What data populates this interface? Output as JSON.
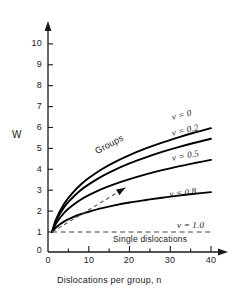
{
  "chart_data": {
    "type": "line",
    "title": "",
    "xlabel": "Dislocations per group, n",
    "ylabel": "W",
    "xlim": [
      0,
      42
    ],
    "ylim": [
      0,
      10.6
    ],
    "xticks": [
      0,
      10,
      20,
      30,
      40
    ],
    "xtick_labels": [
      "0",
      "10",
      "20",
      "30",
      "40"
    ],
    "x_minor_ticks": [
      5,
      15,
      25,
      35
    ],
    "yticks": [
      0,
      1,
      2,
      3,
      4,
      5,
      6,
      7,
      8,
      9,
      10
    ],
    "ytick_labels": [
      "0",
      "1",
      "2",
      "3",
      "4",
      "5",
      "6",
      "7",
      "8",
      "9",
      "10"
    ],
    "grid": false,
    "legend_position": "inline-curve-labels",
    "series": [
      {
        "name": "ν = 0",
        "label": "ν = 0",
        "style": "solid",
        "x": [
          1,
          2,
          4,
          6,
          8,
          10,
          13,
          16,
          20,
          24,
          28,
          32,
          36,
          40
        ],
        "y": [
          1.0,
          1.62,
          2.36,
          2.86,
          3.26,
          3.58,
          3.98,
          4.31,
          4.68,
          5.0,
          5.28,
          5.53,
          5.76,
          5.97
        ]
      },
      {
        "name": "ν = 0.2",
        "label": "ν = 0.2",
        "style": "solid",
        "x": [
          1,
          2,
          4,
          6,
          8,
          10,
          13,
          16,
          20,
          24,
          28,
          32,
          36,
          40
        ],
        "y": [
          1.0,
          1.55,
          2.2,
          2.64,
          3.0,
          3.28,
          3.64,
          3.94,
          4.28,
          4.57,
          4.83,
          5.06,
          5.27,
          5.46
        ]
      },
      {
        "name": "ν = 0.5",
        "label": "ν = 0.5",
        "style": "solid",
        "x": [
          1,
          2,
          4,
          6,
          8,
          10,
          13,
          16,
          20,
          24,
          28,
          32,
          36,
          40
        ],
        "y": [
          1.0,
          1.42,
          1.93,
          2.27,
          2.54,
          2.76,
          3.04,
          3.27,
          3.53,
          3.76,
          3.96,
          4.14,
          4.3,
          4.45
        ]
      },
      {
        "name": "ν = 0.8",
        "label": "ν = 0.8",
        "style": "solid",
        "x": [
          1,
          2,
          4,
          6,
          8,
          10,
          13,
          16,
          20,
          24,
          28,
          32,
          36,
          40
        ],
        "y": [
          1.0,
          1.23,
          1.51,
          1.7,
          1.85,
          1.97,
          2.13,
          2.26,
          2.41,
          2.53,
          2.64,
          2.74,
          2.83,
          2.91
        ]
      },
      {
        "name": "ν = 1.0",
        "label": "ν = 1.0",
        "style": "dashed",
        "x": [
          1,
          40
        ],
        "y": [
          1.0,
          1.0
        ]
      }
    ],
    "annotations": [
      {
        "name": "groups",
        "text": "Groups",
        "x": 13,
        "y": 4.25,
        "rotation": -30
      },
      {
        "name": "single-dislocations",
        "text": "Single dislocations",
        "x": 24,
        "y": 0.62
      },
      {
        "name": "guide-arrow",
        "text": "",
        "style": "dashed-arrow",
        "x_start": 1,
        "y_start": 1.0,
        "x_end": 19,
        "y_end": 3.12
      }
    ]
  },
  "labels": {
    "ylabel": "W",
    "xlabel": "Dislocations per group, n",
    "groups": "Groups",
    "single_dislocations": "Single dislocations",
    "nu_0": "ν = 0",
    "nu_02": "ν = 0.2",
    "nu_05": "ν = 0.5",
    "nu_08": "ν = 0.8",
    "nu_10": "ν = 1.0"
  },
  "ticks": {
    "y": [
      "10",
      "9",
      "8",
      "7",
      "6",
      "5",
      "4",
      "3",
      "2",
      "1",
      "0"
    ],
    "x": [
      "0",
      "10",
      "20",
      "30",
      "40"
    ]
  },
  "colors": {
    "axis": "#1a1a1a",
    "curve": "#000000",
    "dashed": "#555555",
    "background": "#ffffff"
  }
}
